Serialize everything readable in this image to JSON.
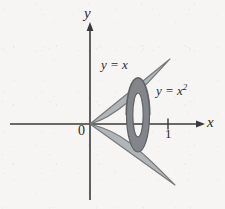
{
  "figure": {
    "name": "solid-of-revolution-washer-diagram",
    "background_color": "#f6f5f3",
    "ink_color": "#2b2b2b",
    "region_fill": "#b2b5b7",
    "region_stroke": "#6e7274",
    "washer_fill": "#82868a",
    "washer_stroke": "#5d6164"
  },
  "axes": {
    "x_label": "x",
    "y_label": "y",
    "origin_label": "0",
    "x_ticks": [
      {
        "label": "1",
        "value": 1
      }
    ],
    "x_range": [
      -1.6,
      2.35
    ],
    "y_range": [
      -1.8,
      2.1
    ],
    "arrows": [
      "x-positive",
      "y-positive"
    ]
  },
  "curves": [
    {
      "name": "line",
      "label": "y = x",
      "equation": "y = x"
    },
    {
      "name": "parabola",
      "label_prefix": "y = x",
      "label_sup": "2",
      "equation": "y = x^2"
    }
  ],
  "annotations": {
    "region_description": "Region between y = x and y = x^2 revolved about the x-axis",
    "washer_description": "Representative washer (annulus) cross-section"
  }
}
